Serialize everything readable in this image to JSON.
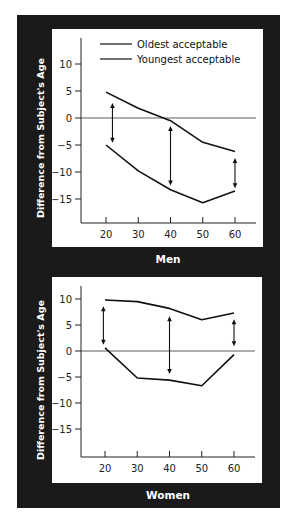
{
  "chart_data": [
    {
      "type": "line",
      "title": "Men",
      "xlabel": "",
      "ylabel": "Difference from Subject's Age",
      "x": [
        20,
        30,
        40,
        50,
        60
      ],
      "xticks": [
        20,
        30,
        40,
        50,
        60
      ],
      "yticks": [
        10,
        5,
        0,
        -5,
        -10,
        -15
      ],
      "ylim": [
        -20,
        14
      ],
      "legend": [
        "Oldest acceptable",
        "Youngest acceptable"
      ],
      "legend_position": "upper inside plot",
      "series": [
        {
          "name": "Oldest acceptable",
          "values": [
            4.8,
            1.8,
            -0.5,
            -4.5,
            -6.2
          ]
        },
        {
          "name": "Youngest acceptable",
          "values": [
            -5.0,
            -9.8,
            -13.3,
            -15.7,
            -13.5
          ]
        }
      ],
      "range_arrows": [
        {
          "x": 22,
          "from": 2.8,
          "to": -4.6
        },
        {
          "x": 40,
          "from": -1.5,
          "to": -12.5
        },
        {
          "x": 60,
          "from": -7.4,
          "to": -13.0
        }
      ],
      "zero_line": true,
      "grid": false
    },
    {
      "type": "line",
      "title": "Women",
      "xlabel": "",
      "ylabel": "Difference from Subject's Age",
      "x": [
        20,
        30,
        40,
        50,
        60
      ],
      "xticks": [
        20,
        30,
        40,
        50,
        60
      ],
      "yticks": [
        10,
        5,
        0,
        -5,
        -10,
        -15
      ],
      "ylim": [
        -20,
        12
      ],
      "series": [
        {
          "name": "Oldest acceptable",
          "values": [
            9.8,
            9.5,
            8.2,
            6.0,
            7.3
          ]
        },
        {
          "name": "Youngest acceptable",
          "values": [
            0.6,
            -5.2,
            -5.6,
            -6.7,
            -0.7
          ]
        }
      ],
      "range_arrows": [
        {
          "x": 19.5,
          "from": 8.6,
          "to": 1.2
        },
        {
          "x": 40,
          "from": 6.7,
          "to": -4.4
        },
        {
          "x": 60,
          "from": 6.1,
          "to": 0.9
        }
      ],
      "zero_line": true,
      "grid": false
    }
  ],
  "figure": {
    "ylabel": "Difference from Subject's Age",
    "panels": [
      {
        "title": "Men"
      },
      {
        "title": "Women"
      }
    ],
    "legend": {
      "oldest": "Oldest acceptable",
      "youngest": "Youngest acceptable"
    },
    "colors": {
      "frame": "#1a1a1a",
      "panel": "#ffffff",
      "line": "#111111"
    }
  }
}
